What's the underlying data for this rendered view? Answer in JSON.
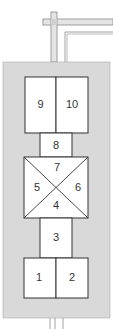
{
  "colors": {
    "enclosure": "#d9d9d9",
    "box_fill": "#ffffff",
    "stroke": "#333333",
    "pipe_stroke": "#8a8a8a",
    "pipe_fill": "#e4e4e4"
  },
  "compartments": {
    "c1": "1",
    "c2": "2",
    "c3": "3",
    "c4": "4",
    "c5": "5",
    "c6": "6",
    "c7": "7",
    "c8": "8",
    "c9": "9",
    "c10": "10"
  }
}
